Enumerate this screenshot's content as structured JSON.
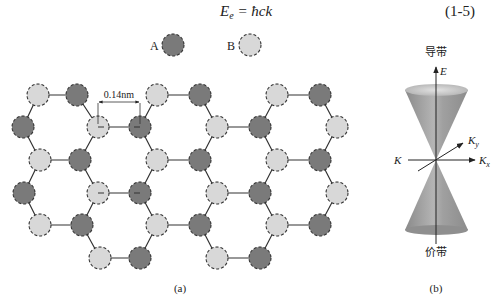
{
  "equation": {
    "lhs_symbol": "E",
    "lhs_subscript": "e",
    "rhs": "= ħck",
    "number": "(1-5)"
  },
  "panel_a": {
    "caption": "(a)",
    "legend": [
      {
        "label": "A",
        "fill": "#7a7a7a"
      },
      {
        "label": "B",
        "fill": "#d8d8d8"
      }
    ],
    "bond_length_label": "0.14nm",
    "atom_colors": {
      "A": "#7a7a7a",
      "B": "#d8d8d8",
      "outline": "#333333"
    }
  },
  "panel_b": {
    "caption": "(b)",
    "conduction_band_label": "导带",
    "valence_band_label": "价带",
    "axis_labels": {
      "energy": "E",
      "k": "K",
      "ky": "K",
      "ky_sub": "y",
      "kx": "K",
      "kx_sub": "x"
    },
    "cone_color": "#9a9a9a"
  }
}
